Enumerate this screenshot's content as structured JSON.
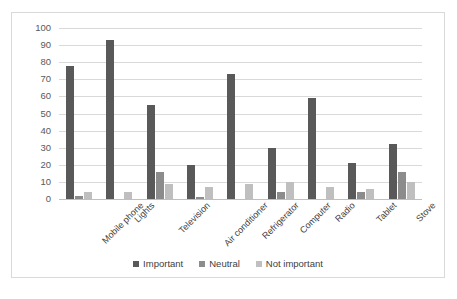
{
  "chart_data": {
    "type": "bar",
    "title": "",
    "subtitle": "",
    "xlabel": "",
    "ylabel": "",
    "ylim": [
      0,
      100
    ],
    "yticks": [
      0,
      10,
      20,
      30,
      40,
      50,
      60,
      70,
      80,
      90,
      100
    ],
    "grid": true,
    "legend_position": "bottom",
    "categories": [
      "Mobile phone",
      "Lights",
      "Television",
      "Air conditioner",
      "Refrigerator",
      "Computer",
      "Radio",
      "Tablet",
      "Stove"
    ],
    "series": [
      {
        "name": "Important",
        "color": "#595959",
        "values": [
          78,
          93,
          55,
          20,
          73,
          30,
          59,
          21,
          32
        ]
      },
      {
        "name": "Neutral",
        "color": "#8c8c8c",
        "values": [
          2,
          0,
          16,
          1,
          0,
          4,
          0,
          4,
          16
        ]
      },
      {
        "name": "Not important",
        "color": "#bfbfbf",
        "values": [
          4,
          4,
          9,
          7,
          9,
          10,
          7,
          6,
          10
        ]
      }
    ]
  },
  "legend": {
    "items": [
      {
        "label": "Important",
        "swatch": "legend-swatch-important"
      },
      {
        "label": "Neutral",
        "swatch": "legend-swatch-neutral"
      },
      {
        "label": "Not important",
        "swatch": "legend-swatch-not-important"
      }
    ]
  },
  "colors": {
    "series_important": "#595959",
    "series_neutral": "#8c8c8c",
    "series_not_important": "#bfbfbf",
    "gridline": "#d9d9d9",
    "frame_border": "#d9d9d9",
    "tick_text": "#595959",
    "label_text": "#404040",
    "background": "#ffffff"
  }
}
